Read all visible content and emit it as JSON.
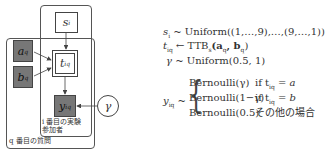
{
  "diagram": {
    "nodes": {
      "s": {
        "label": "s",
        "sub": "i"
      },
      "a": {
        "label": "a",
        "sub": "q"
      },
      "b": {
        "label": "b",
        "sub": "q"
      },
      "t": {
        "label": "t",
        "sub": "iq"
      },
      "y": {
        "label": "y",
        "sub": "iq"
      },
      "gamma": {
        "label": "γ"
      }
    },
    "plates": {
      "participant": {
        "line1": "i 番目の実験",
        "line2": "参加者"
      },
      "question": {
        "label": "q 番目の質問"
      }
    }
  },
  "equations": {
    "eq1": {
      "lhs": "s",
      "lhs_sub": "i",
      "rel": "~",
      "rhs": "Uniform((1,…,9),…,(9,…,1))"
    },
    "eq2": {
      "lhs": "t",
      "lhs_sub": "iq",
      "rel": "←",
      "rhs_pre": "TTB",
      "rhs_sub": "s",
      "rhs_args": "(a",
      "rhs_a_sub": "q",
      "rhs_mid": ", b",
      "rhs_b_sub": "q",
      "rhs_end": ")"
    },
    "eq3": {
      "lhs": "γ",
      "rel": "~",
      "rhs": "Uniform(0.5, 1)"
    },
    "eq4": {
      "lhs": "y",
      "lhs_sub": "iq",
      "rel": "~",
      "cases": [
        {
          "dist": "Bernoulli(γ)",
          "cond_pre": "if t",
          "cond_sub": "iq",
          "cond_post": " = a"
        },
        {
          "dist": "Bernoulli(1−γ)",
          "cond_pre": "if t",
          "cond_sub": "iq",
          "cond_post": " = b"
        },
        {
          "dist": "Bernoulli(0.5)",
          "cond_pre": "その他の場合",
          "cond_sub": "",
          "cond_post": ""
        }
      ]
    }
  }
}
